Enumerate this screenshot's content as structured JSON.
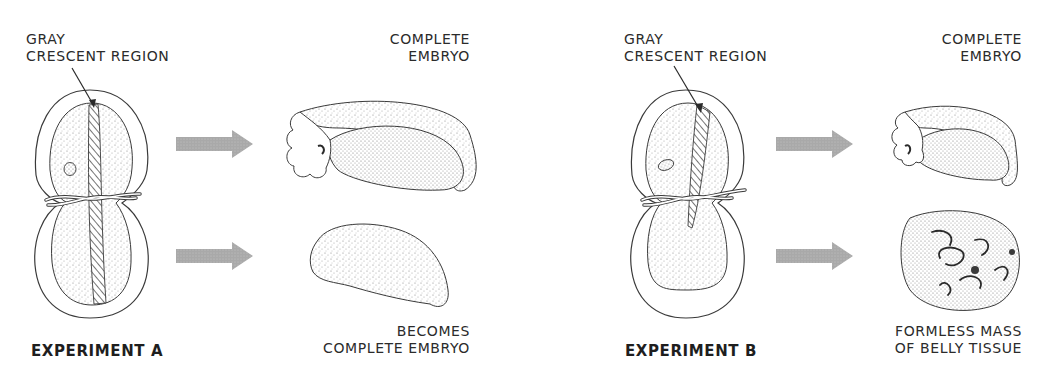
{
  "figure": {
    "colors": {
      "arrow": "#a9a9a9",
      "line": "#3a3a3a",
      "stipple": "#8a8a8a",
      "background": "#ffffff"
    }
  },
  "experiment_a": {
    "title": "EXPERIMENT A",
    "pointer_label_line1": "GRAY",
    "pointer_label_line2": "CRESCENT REGION",
    "top_result_line1": "COMPLETE",
    "top_result_line2": "EMBRYO",
    "bottom_result_line1": "BECOMES",
    "bottom_result_line2": "COMPLETE EMBRYO"
  },
  "experiment_b": {
    "title": "EXPERIMENT B",
    "pointer_label_line1": "GRAY",
    "pointer_label_line2": "CRESCENT REGION",
    "top_result_line1": "COMPLETE",
    "top_result_line2": "EMBRYO",
    "bottom_result_line1": "FORMLESS MASS",
    "bottom_result_line2": "OF BELLY TISSUE"
  }
}
